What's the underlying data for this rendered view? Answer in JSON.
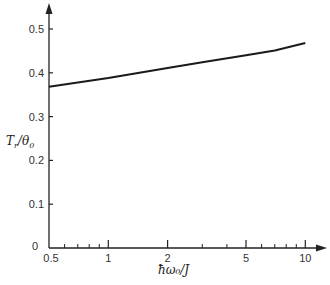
{
  "chart_data": {
    "type": "line",
    "title": "",
    "xlabel": "ħω₀/J",
    "ylabel": "T_r/θ₀",
    "xscale": "log",
    "xlim": [
      0.5,
      11
    ],
    "ylim": [
      0,
      0.55
    ],
    "grid": false,
    "legend": null,
    "x_ticks": [
      0.5,
      1,
      2,
      5,
      10
    ],
    "x_tick_labels": [
      "0.5",
      "1",
      "2",
      "5",
      "10"
    ],
    "x_minor_ticks": [
      0.6,
      0.7,
      0.8,
      0.9,
      3,
      4,
      6,
      7,
      8,
      9
    ],
    "y_ticks": [
      0,
      0.1,
      0.2,
      0.3,
      0.4,
      0.5
    ],
    "y_tick_labels": [
      "0",
      "0.1",
      "0.2",
      "0.3",
      "0.4",
      "0.5"
    ],
    "series": [
      {
        "name": "T_r/θ₀",
        "x": [
          0.5,
          1,
          2,
          3,
          5,
          7,
          10
        ],
        "y": [
          0.368,
          0.388,
          0.411,
          0.424,
          0.44,
          0.451,
          0.468
        ]
      }
    ]
  },
  "labels": {
    "x_axis": "ħω₀/J",
    "y_axis_main": "T",
    "y_axis_sub1": "r",
    "y_axis_rest": "/θ",
    "y_axis_sub2": "0"
  }
}
